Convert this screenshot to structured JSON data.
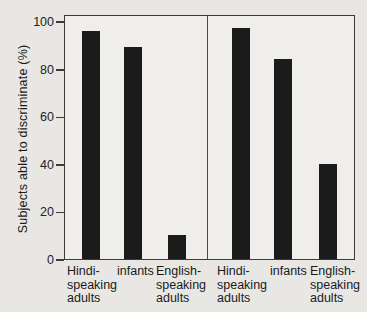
{
  "figure": {
    "background_color": "#e8e7e4",
    "plot_background_color": "#efeeea",
    "bar_color": "#1b1b1b",
    "frame_color": "#3b3b3b",
    "text_color": "#1a1a1a"
  },
  "chart_data": {
    "type": "bar",
    "title": "",
    "xlabel": "",
    "ylabel": "Subjects able to discriminate (%)",
    "ylim": [
      0,
      100
    ],
    "yticks": [
      0,
      20,
      40,
      60,
      80,
      100
    ],
    "grid": false,
    "legend": "none",
    "layout_hint": "two side-by-side panels sharing one y-axis, separated by a vertical divider line",
    "categories": [
      "Hindi-speaking adults",
      "infants",
      "English-speaking adults"
    ],
    "category_tick_lines": [
      [
        "Hindi-",
        "speaking",
        "adults"
      ],
      [
        "infants"
      ],
      [
        "English-",
        "speaking",
        "adults"
      ]
    ],
    "series": [
      {
        "name": "left-panel",
        "values": [
          96,
          89,
          10
        ]
      },
      {
        "name": "right-panel",
        "values": [
          97,
          84,
          40
        ]
      }
    ]
  }
}
